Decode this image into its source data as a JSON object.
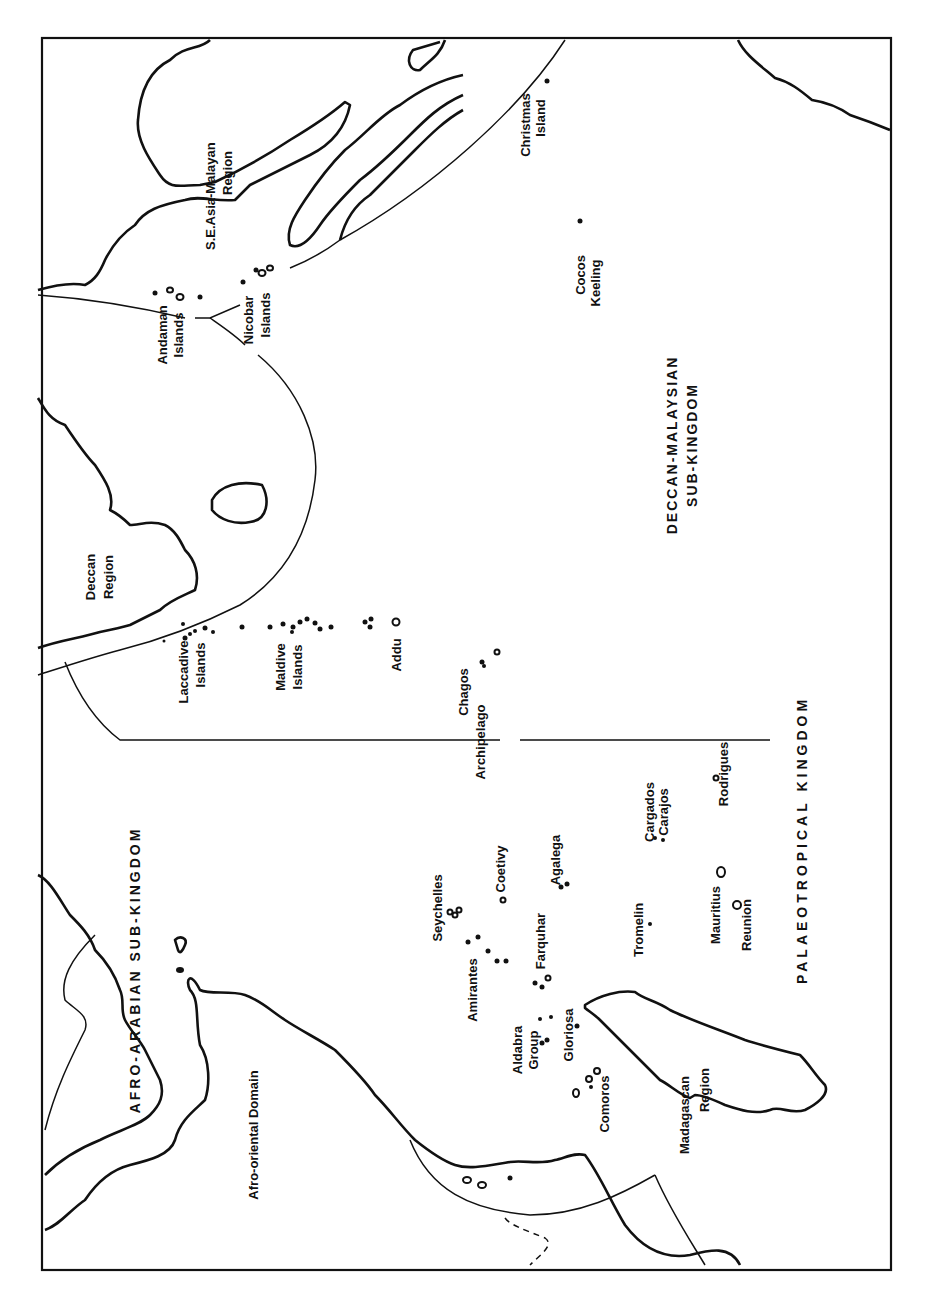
{
  "map": {
    "orientation": "rotated 90° counter-clockwise",
    "kingdom": "PALAEOTROPICAL KINGDOM",
    "sub_kingdoms": {
      "afro_arabian": "AFRO-ARABIAN SUB-KINGDOM",
      "deccan_malaysian_line1": "DECCAN-MALAYSIAN",
      "deccan_malaysian_line2": "SUB-KINGDOM"
    },
    "regions": {
      "afro_oriental": "Afro-oriental Domain",
      "madagascan_line1": "Madagascan",
      "madagascan_line2": "Region",
      "deccan_line1": "Deccan",
      "deccan_line2": "Region",
      "se_asia_line1": "S.E.Asia-Malayan",
      "se_asia_line2": "Region"
    },
    "islands": {
      "andaman_1": "Andaman",
      "andaman_2": "Islands",
      "nicobar_1": "Nicobar",
      "nicobar_2": "Islands",
      "christmas_1": "Christmas",
      "christmas_2": "Island",
      "cocos_1": "Cocos",
      "cocos_2": "Keeling",
      "laccadive_1": "Laccadive",
      "laccadive_2": "Islands",
      "maldive_1": "Maldive",
      "maldive_2": "Islands",
      "addu": "Addu",
      "chagos_1": "Chagos",
      "chagos_2": "Archipelago",
      "seychelles": "Seychelles",
      "amirantes": "Amirantes",
      "coetivy": "Coetivy",
      "agalega": "Agalega",
      "farquhar": "Farquhar",
      "aldabra_1": "Aldabra",
      "aldabra_2": "Group",
      "gloriosa": "Gloriosa",
      "comoros": "Comoros",
      "tromelin": "Tromelin",
      "cargados_1": "Cargados",
      "cargados_2": "Carajos",
      "rodrigues": "Rodrigues",
      "mauritius": "Mauritius",
      "reunion": "Reunion"
    }
  }
}
